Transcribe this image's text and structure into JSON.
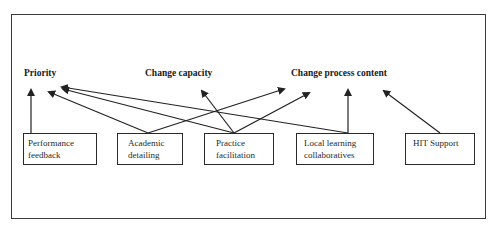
{
  "diagram": {
    "outcomes": [
      {
        "id": "priority",
        "label": "Priority"
      },
      {
        "id": "change_capacity",
        "label": "Change capacity"
      },
      {
        "id": "change_process_content",
        "label": "Change process content"
      }
    ],
    "interventions": [
      {
        "id": "performance_feedback",
        "line1": "Performance",
        "line2": "feedback"
      },
      {
        "id": "academic_detailing",
        "line1": "Academic",
        "line2": "detailing"
      },
      {
        "id": "practice_facilitation",
        "line1": "Practice",
        "line2": "facilitation"
      },
      {
        "id": "local_learning_collaboratives",
        "line1": "Local learning",
        "line2": "collaboratives"
      },
      {
        "id": "hit_support",
        "line1": "HIT Support",
        "line2": ""
      }
    ],
    "edges": [
      {
        "from": "performance_feedback",
        "to": "priority"
      },
      {
        "from": "academic_detailing",
        "to": "priority"
      },
      {
        "from": "academic_detailing",
        "to": "change_process_content"
      },
      {
        "from": "practice_facilitation",
        "to": "priority"
      },
      {
        "from": "practice_facilitation",
        "to": "change_capacity"
      },
      {
        "from": "practice_facilitation",
        "to": "change_process_content"
      },
      {
        "from": "local_learning_collaboratives",
        "to": "priority"
      },
      {
        "from": "local_learning_collaboratives",
        "to": "change_process_content"
      },
      {
        "from": "hit_support",
        "to": "change_process_content"
      }
    ],
    "colors": {
      "line": "#222222",
      "border": "#3a3a3a",
      "background": "#ffffff"
    }
  }
}
